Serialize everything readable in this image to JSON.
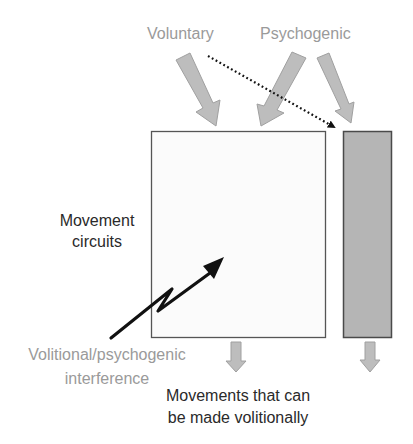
{
  "labels": {
    "voluntary": "Voluntary",
    "psychogenic": "Psychogenic",
    "movement_circuits_line1": "Movement",
    "movement_circuits_line2": "circuits",
    "interference_line1": "Volitional/psychogenic",
    "interference_line2": "interference",
    "output_line1": "Movements that can",
    "output_line2": "be made volitionally"
  },
  "colors": {
    "input_arrow_fill": "#bdbdbd",
    "input_arrow_stroke": "#9e9e9e",
    "main_box_fill": "#fbfbfb",
    "main_box_stroke": "#555555",
    "side_box_fill": "#b5b5b5",
    "side_box_stroke": "#4a4a4a",
    "gray_text": "#9a9a9a",
    "dark_text": "#2a2a2a",
    "dotted_arrow": "#111111",
    "interference_arrow": "#111111"
  }
}
